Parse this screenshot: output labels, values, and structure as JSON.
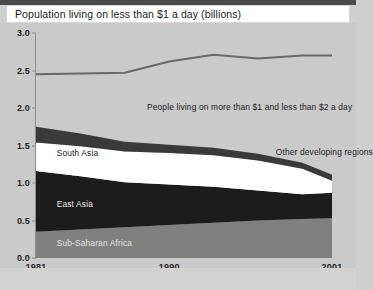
{
  "title": "Population living on less than $1 a day (billions)",
  "chart_data": {
    "type": "area",
    "title": "Population living on less than $1 a day (billions)",
    "xlabel": "",
    "ylabel": "billions",
    "ylim": [
      0.0,
      3.0
    ],
    "xlim": [
      1981,
      2001
    ],
    "ytick_labels": [
      "3.0",
      "2.5",
      "2.0",
      "1.5",
      "1.0",
      "0.5",
      "0.0"
    ],
    "ytick_values": [
      3.0,
      2.5,
      2.0,
      1.5,
      1.0,
      0.5,
      0.0
    ],
    "xtick_labels": [
      "1981",
      "1990",
      "2001"
    ],
    "xtick_values": [
      1981,
      1990,
      2001
    ],
    "grid": false,
    "legend": "inline-annotations",
    "stacked": true,
    "x": [
      1981,
      1984,
      1987,
      1990,
      1993,
      1996,
      1999,
      2001
    ],
    "series": [
      {
        "name": "Sub-Saharan Africa",
        "color": "#808080",
        "values": [
          0.35,
          0.38,
          0.41,
          0.44,
          0.47,
          0.5,
          0.52,
          0.53
        ]
      },
      {
        "name": "East Asia",
        "color": "#1c1c1c",
        "values": [
          0.81,
          0.71,
          0.6,
          0.54,
          0.48,
          0.4,
          0.33,
          0.34
        ]
      },
      {
        "name": "South Asia",
        "color": "#ffffff",
        "values": [
          0.38,
          0.4,
          0.41,
          0.42,
          0.42,
          0.4,
          0.34,
          0.16
        ]
      },
      {
        "name": "Other developing regions",
        "color": "#3a3a3a",
        "values": [
          0.21,
          0.17,
          0.13,
          0.11,
          0.1,
          0.09,
          0.08,
          0.08
        ]
      }
    ],
    "total_line": {
      "name": "People living on more than $1 and less than $2 a day",
      "color": "#686868",
      "values": [
        2.45,
        2.46,
        2.47,
        2.62,
        2.71,
        2.66,
        2.7,
        2.7
      ]
    },
    "annotations": [
      {
        "text": "People living on more than $1 and less than $2 a day",
        "x": 1988.5,
        "y": 2.02
      },
      {
        "text": "South Asia",
        "x": 1982.4,
        "y": 1.4
      },
      {
        "text": "Other developing regions",
        "x": 1997.2,
        "y": 1.42
      },
      {
        "text": "East Asia",
        "x": 1982.4,
        "y": 0.72
      },
      {
        "text": "Sub-Saharan Africa",
        "x": 1982.4,
        "y": 0.2
      }
    ]
  },
  "labels": {
    "poverty_band": "People living on more than $1 and less than $2 a day",
    "south_asia": "South Asia",
    "other_developing": "Other developing regions",
    "east_asia": "East Asia",
    "sub_saharan_africa": "Sub-Saharan Africa"
  },
  "axis": {
    "y": [
      "3.0",
      "2.5",
      "2.0",
      "1.5",
      "1.0",
      "0.5",
      "0.0"
    ],
    "x": [
      "1981",
      "1990",
      "2001"
    ]
  },
  "colors": {
    "background": "#cacaca",
    "title_bar": "#ffffff",
    "top_strip": "#4a4a4a",
    "sub_saharan_africa": "#808080",
    "east_asia": "#1c1c1c",
    "south_asia": "#ffffff",
    "other_developing": "#3a3a3a",
    "total_line": "#686868",
    "axis": "#8e8e8e"
  }
}
